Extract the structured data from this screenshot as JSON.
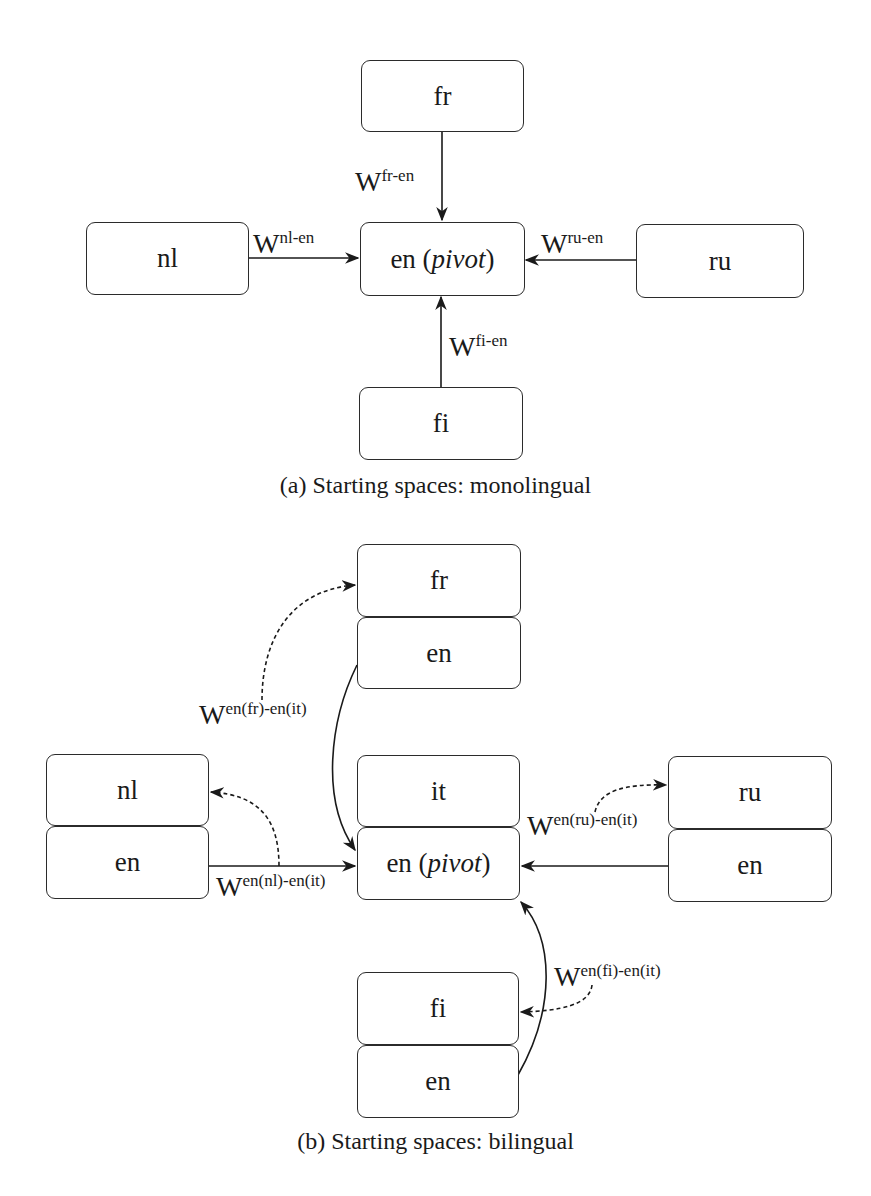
{
  "figure_a": {
    "caption": "(a) Starting spaces: monolingual",
    "nodes": {
      "fr": "fr",
      "nl": "nl",
      "pivot_lang": "en",
      "pivot_paren_open": " (",
      "pivot_word": "pivot",
      "pivot_paren_close": ")",
      "ru": "ru",
      "fi": "fi"
    },
    "edges": {
      "fr": {
        "base": "W",
        "sup": "fr-en"
      },
      "nl": {
        "base": "W",
        "sup": "nl-en"
      },
      "ru": {
        "base": "W",
        "sup": "ru-en"
      },
      "fi": {
        "base": "W",
        "sup": "fi-en"
      }
    }
  },
  "figure_b": {
    "caption": "(b) Starting spaces: bilingual",
    "nodes": {
      "fr_top": "fr",
      "fr_bottom": "en",
      "nl_top": "nl",
      "nl_bottom": "en",
      "it_top": "it",
      "pivot_lang": "en",
      "pivot_paren_open": " (",
      "pivot_word": "pivot",
      "pivot_paren_close": ")",
      "ru_top": "ru",
      "ru_bottom": "en",
      "fi_top": "fi",
      "fi_bottom": "en"
    },
    "edges": {
      "fr": {
        "base": "W",
        "sup": "en(fr)-en(it)"
      },
      "nl": {
        "base": "W",
        "sup": "en(nl)-en(it)"
      },
      "ru": {
        "base": "W",
        "sup": "en(ru)-en(it)"
      },
      "fi": {
        "base": "W",
        "sup": "en(fi)-en(it)"
      }
    }
  }
}
